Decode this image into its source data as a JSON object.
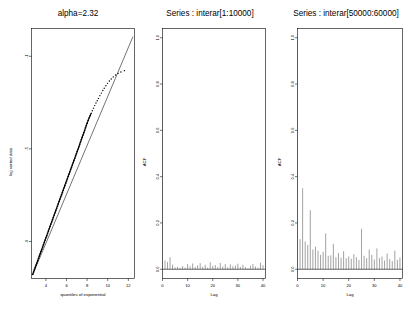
{
  "figure": {
    "background": "#ffffff",
    "foreground": "#000000",
    "bar_color": "#555555",
    "panel_count": 3
  },
  "chart_data": [
    {
      "type": "scatter",
      "panel": "left",
      "title": "alpha=2.32",
      "xlabel": "quantiles of exponential",
      "ylabel": "log sorted data",
      "xlim": [
        2.6,
        12.6
      ],
      "ylim": [
        -10.6,
        0.2
      ],
      "xticks": [
        4,
        6,
        8,
        10,
        12
      ],
      "yticks": [
        -1,
        -5,
        -9
      ],
      "xtick_labels": [
        "4",
        "6",
        "8",
        "10",
        "12"
      ],
      "ytick_labels": [
        "-1",
        "-5",
        "-9"
      ],
      "grid": false,
      "legend": "none",
      "reference_line": {
        "description": "straight diagonal fit line",
        "x0": 2.7,
        "y0": -10.45,
        "x1": 12.45,
        "y1": -0.15
      },
      "series": [
        {
          "name": "log sorted data vs exponential quantiles",
          "marker": "point",
          "x": [
            2.72,
            2.8,
            2.88,
            2.96,
            3.04,
            3.12,
            3.2,
            3.28,
            3.36,
            3.44,
            3.52,
            3.6,
            3.68,
            3.76,
            3.84,
            3.92,
            4.0,
            4.08,
            4.16,
            4.24,
            4.32,
            4.4,
            4.48,
            4.56,
            4.64,
            4.72,
            4.8,
            4.88,
            4.96,
            5.04,
            5.12,
            5.2,
            5.28,
            5.36,
            5.44,
            5.52,
            5.6,
            5.68,
            5.76,
            5.84,
            5.92,
            6.0,
            6.08,
            6.16,
            6.24,
            6.32,
            6.4,
            6.48,
            6.56,
            6.64,
            6.72,
            6.8,
            6.88,
            6.96,
            7.04,
            7.12,
            7.2,
            7.28,
            7.36,
            7.44,
            7.52,
            7.6,
            7.68,
            7.76,
            7.84,
            7.92,
            8.0,
            8.1,
            8.2,
            8.3,
            8.4,
            8.5,
            8.62,
            8.74,
            8.86,
            8.98,
            9.1,
            9.24,
            9.38,
            9.52,
            9.66,
            9.82,
            9.98,
            10.16,
            10.34,
            10.54,
            10.76,
            11.0,
            11.28,
            11.62
          ],
          "y": [
            -10.42,
            -10.32,
            -10.22,
            -10.12,
            -10.02,
            -9.93,
            -9.83,
            -9.73,
            -9.63,
            -9.53,
            -9.43,
            -9.34,
            -9.24,
            -9.14,
            -9.04,
            -8.94,
            -8.84,
            -8.75,
            -8.65,
            -8.55,
            -8.45,
            -8.35,
            -8.25,
            -8.16,
            -8.06,
            -7.96,
            -7.86,
            -7.76,
            -7.66,
            -7.57,
            -7.47,
            -7.37,
            -7.27,
            -7.17,
            -7.07,
            -6.98,
            -6.88,
            -6.78,
            -6.68,
            -6.58,
            -6.48,
            -6.39,
            -6.29,
            -6.19,
            -6.09,
            -5.99,
            -5.89,
            -5.8,
            -5.7,
            -5.6,
            -5.5,
            -5.4,
            -5.3,
            -5.21,
            -5.11,
            -5.01,
            -4.91,
            -4.8,
            -4.7,
            -4.6,
            -4.5,
            -4.4,
            -4.3,
            -4.2,
            -4.09,
            -3.99,
            -3.89,
            -3.77,
            -3.66,
            -3.56,
            -3.46,
            -3.35,
            -3.24,
            -3.13,
            -3.02,
            -2.92,
            -2.82,
            -2.7,
            -2.59,
            -2.48,
            -2.38,
            -2.27,
            -2.17,
            -2.07,
            -1.98,
            -1.89,
            -1.81,
            -1.74,
            -1.68,
            -1.62
          ]
        }
      ]
    },
    {
      "type": "bar",
      "panel": "middle",
      "title": "Series : interar[1:10000]",
      "xlabel": "Lag",
      "ylabel": "ACF",
      "xlim": [
        0,
        41
      ],
      "ylim": [
        -0.04,
        1.04
      ],
      "xticks": [
        0,
        10,
        20,
        30,
        40
      ],
      "yticks": [
        0.0,
        0.2,
        0.4,
        0.6,
        0.8,
        1.0
      ],
      "xtick_labels": [
        "0",
        "10",
        "20",
        "30",
        "40"
      ],
      "ytick_labels": [
        "0.0",
        "0.2",
        "0.4",
        "0.6",
        "0.8",
        "1.0"
      ],
      "grid": false,
      "legend": "none",
      "categories": [
        0,
        1,
        2,
        3,
        4,
        5,
        6,
        7,
        8,
        9,
        10,
        11,
        12,
        13,
        14,
        15,
        16,
        17,
        18,
        19,
        20,
        21,
        22,
        23,
        24,
        25,
        26,
        27,
        28,
        29,
        30,
        31,
        32,
        33,
        34,
        35,
        36,
        37,
        38,
        39,
        40
      ],
      "values": [
        1.0,
        0.038,
        0.031,
        0.052,
        0.02,
        0.008,
        0.01,
        0.006,
        0.014,
        0.007,
        0.022,
        0.013,
        0.025,
        0.01,
        0.017,
        0.026,
        0.011,
        0.019,
        0.007,
        0.03,
        0.014,
        0.018,
        0.009,
        0.027,
        0.012,
        0.022,
        0.008,
        0.021,
        0.013,
        0.016,
        0.024,
        0.01,
        0.019,
        0.009,
        0.004,
        0.015,
        0.023,
        0.012,
        0.007,
        0.028,
        0.018
      ]
    },
    {
      "type": "bar",
      "panel": "right",
      "title": "Series : interar[50000:60000]",
      "xlabel": "Lag",
      "ylabel": "ACF",
      "xlim": [
        0,
        41
      ],
      "ylim": [
        -0.04,
        1.04
      ],
      "xticks": [
        0,
        10,
        20,
        30,
        40
      ],
      "yticks": [
        0.0,
        0.2,
        0.4,
        0.6,
        0.8,
        1.0
      ],
      "xtick_labels": [
        "0",
        "10",
        "20",
        "30",
        "40"
      ],
      "ytick_labels": [
        "0.0",
        "0.2",
        "0.4",
        "0.6",
        "0.8",
        "1.0"
      ],
      "grid": false,
      "legend": "none",
      "categories": [
        0,
        1,
        2,
        3,
        4,
        5,
        6,
        7,
        8,
        9,
        10,
        11,
        12,
        13,
        14,
        15,
        16,
        17,
        18,
        19,
        20,
        21,
        22,
        23,
        24,
        25,
        26,
        27,
        28,
        29,
        30,
        31,
        32,
        33,
        34,
        35,
        36,
        37,
        38,
        39,
        40
      ],
      "values": [
        1.0,
        0.13,
        0.35,
        0.12,
        0.105,
        0.255,
        0.085,
        0.098,
        0.08,
        0.062,
        0.075,
        0.155,
        0.058,
        0.06,
        0.11,
        0.052,
        0.07,
        0.05,
        0.078,
        0.048,
        0.055,
        0.045,
        0.065,
        0.052,
        0.04,
        0.175,
        0.058,
        0.048,
        0.085,
        0.062,
        0.042,
        0.09,
        0.048,
        0.055,
        0.038,
        0.068,
        0.044,
        0.035,
        0.08,
        0.04,
        0.05
      ]
    }
  ]
}
